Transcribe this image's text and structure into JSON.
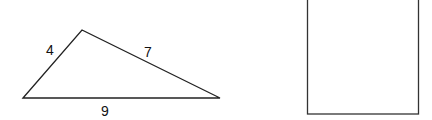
{
  "diagram": {
    "triangle": {
      "vertices": [
        [
          23,
          98
        ],
        [
          82,
          30
        ],
        [
          220,
          98
        ]
      ],
      "stroke": "#222222",
      "side_labels": [
        {
          "text": "4",
          "x": 50,
          "y": 55
        },
        {
          "text": "7",
          "x": 148,
          "y": 57
        },
        {
          "text": "9",
          "x": 105,
          "y": 116
        }
      ]
    },
    "rectangle": {
      "x": 307,
      "y": -2,
      "width": 111,
      "height": 116,
      "stroke": "#333333"
    }
  }
}
